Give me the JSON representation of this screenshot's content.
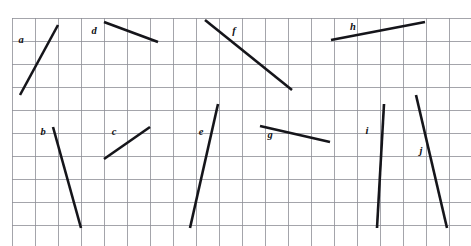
{
  "figure": {
    "background_color": "#ffffff",
    "grid": {
      "line_color": "#8d8f96",
      "origin_x": 12,
      "origin_y": 18,
      "cell_size": 23,
      "cols": 20,
      "rows": 10,
      "visible": true
    },
    "segment_color": "#15151a",
    "segment_width": 2.6,
    "label_color": "#101014"
  },
  "segments": [
    {
      "id": "a",
      "label": "a",
      "x1": 20,
      "y1": 95,
      "x2": 58,
      "y2": 25,
      "label_x": 21,
      "label_y": 41,
      "slope": "positive-steep"
    },
    {
      "id": "b",
      "label": "b",
      "x1": 53,
      "y1": 127,
      "x2": 81,
      "y2": 228,
      "label_x": 43,
      "label_y": 133,
      "slope": "negative-steep"
    },
    {
      "id": "c",
      "label": "c",
      "x1": 104,
      "y1": 159,
      "x2": 150,
      "y2": 127,
      "label_x": 114,
      "label_y": 133,
      "slope": "positive-shallow"
    },
    {
      "id": "d",
      "label": "d",
      "x1": 104,
      "y1": 22,
      "x2": 158,
      "y2": 42,
      "label_x": 94,
      "label_y": 32,
      "slope": "negative-shallow"
    },
    {
      "id": "e",
      "label": "e",
      "x1": 190,
      "y1": 228,
      "x2": 218,
      "y2": 104,
      "label_x": 201,
      "label_y": 133,
      "slope": "positive-steep"
    },
    {
      "id": "f",
      "label": "f",
      "x1": 205,
      "y1": 20,
      "x2": 292,
      "y2": 90,
      "label_x": 234,
      "label_y": 32,
      "slope": "negative-moderate"
    },
    {
      "id": "g",
      "label": "g",
      "x1": 260,
      "y1": 126,
      "x2": 330,
      "y2": 142,
      "label_x": 270,
      "label_y": 136,
      "slope": "negative-shallow"
    },
    {
      "id": "h",
      "label": "h",
      "x1": 331,
      "y1": 40,
      "x2": 425,
      "y2": 22,
      "label_x": 353,
      "label_y": 28,
      "slope": "positive-shallow"
    },
    {
      "id": "i",
      "label": "i",
      "x1": 377,
      "y1": 228,
      "x2": 384,
      "y2": 104,
      "label_x": 367,
      "label_y": 132,
      "slope": "positive-very-steep"
    },
    {
      "id": "j",
      "label": "j",
      "x1": 416,
      "y1": 95,
      "x2": 447,
      "y2": 228,
      "label_x": 421,
      "label_y": 152,
      "slope": "negative-steep"
    }
  ]
}
